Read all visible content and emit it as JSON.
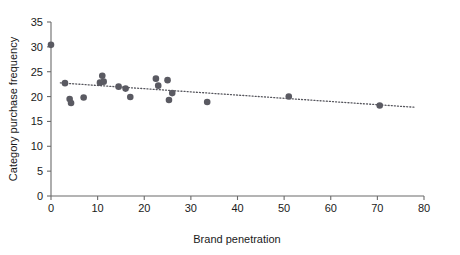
{
  "chart_data": {
    "type": "scatter",
    "title": "",
    "xlabel": "Brand penetration",
    "ylabel": "Category purchase frequency",
    "xlim": [
      0,
      80
    ],
    "ylim": [
      0,
      35
    ],
    "xticks": [
      0,
      10,
      20,
      30,
      40,
      50,
      60,
      70,
      80
    ],
    "yticks": [
      0,
      5,
      10,
      15,
      20,
      25,
      30,
      35
    ],
    "grid": false,
    "legend": null,
    "marker_color": "#5a5a62",
    "trendline": {
      "style": "dotted",
      "color": "#55555c",
      "x_start": 2.0,
      "y_start": 22.75,
      "x_end": 78.0,
      "y_end": 17.85
    },
    "points": [
      {
        "x": 0.0,
        "y": 30.4
      },
      {
        "x": 3.0,
        "y": 22.7
      },
      {
        "x": 4.0,
        "y": 19.5
      },
      {
        "x": 4.3,
        "y": 18.7
      },
      {
        "x": 7.0,
        "y": 19.8
      },
      {
        "x": 10.5,
        "y": 22.8
      },
      {
        "x": 11.0,
        "y": 24.2
      },
      {
        "x": 11.3,
        "y": 23.0
      },
      {
        "x": 14.5,
        "y": 22.0
      },
      {
        "x": 16.0,
        "y": 21.6
      },
      {
        "x": 17.0,
        "y": 19.9
      },
      {
        "x": 22.5,
        "y": 23.6
      },
      {
        "x": 23.0,
        "y": 22.2
      },
      {
        "x": 25.0,
        "y": 23.3
      },
      {
        "x": 25.3,
        "y": 19.3
      },
      {
        "x": 26.0,
        "y": 20.7
      },
      {
        "x": 33.5,
        "y": 18.9
      },
      {
        "x": 51.0,
        "y": 20.0
      },
      {
        "x": 70.5,
        "y": 18.2
      }
    ]
  },
  "axis": {
    "x_tick_labels": [
      "0",
      "10",
      "20",
      "30",
      "40",
      "50",
      "60",
      "70",
      "80"
    ],
    "y_tick_labels": [
      "0",
      "5",
      "10",
      "15",
      "20",
      "25",
      "30",
      "35"
    ],
    "x_title": "Brand penetration",
    "y_title": "Category purchase frequency"
  }
}
